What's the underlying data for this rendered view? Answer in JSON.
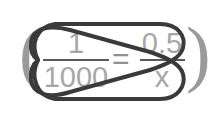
{
  "canvas": {
    "width": 221,
    "height": 125,
    "background": "#ffffff"
  },
  "equation": {
    "open_paren": "(",
    "close_paren": ")",
    "left_fraction": {
      "numerator": "1",
      "denominator": "1000"
    },
    "relation": "=",
    "right_fraction": {
      "numerator": "0.5",
      "denominator": "x"
    },
    "plain_text": "( 1/1000 = 0.5/x )",
    "text_color": "#a6a6a6",
    "bar_color": "#5a5a5a",
    "paren_color": "#9a9a9a"
  },
  "annotation": {
    "kind": "cross-multiplication-bowtie",
    "description": "Two elongated rounded loops crossing in an X over the proportion, linking 1 to x and 1000 to 0.5",
    "stroke_color": "#3a3a3a",
    "stroke_width": 4,
    "loops": [
      {
        "name": "loop-numerator-to-denominator",
        "from": "1",
        "to": "x"
      },
      {
        "name": "loop-denominator-to-numerator",
        "from": "1000",
        "to": "0.5"
      }
    ],
    "crossings": [
      {
        "name": "top-crossing",
        "x": 113,
        "y": 38
      },
      {
        "name": "left-pinch",
        "x": 38,
        "y": 60
      },
      {
        "name": "right-pinch",
        "x": 183,
        "y": 60
      },
      {
        "name": "bottom-crossing",
        "x": 115,
        "y": 83
      }
    ]
  }
}
